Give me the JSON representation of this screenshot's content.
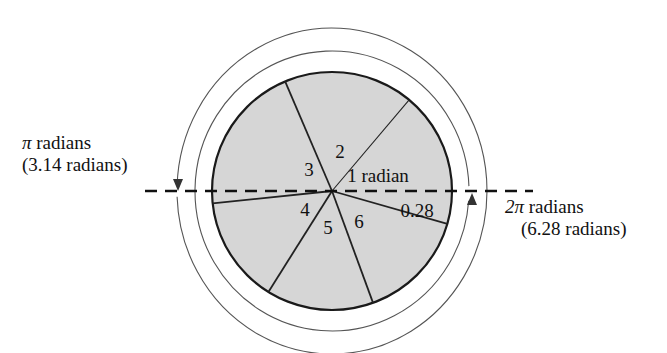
{
  "figure": {
    "colors": {
      "sector_fill": "#d6d6d6",
      "circle_stroke": "#1a1a1a",
      "arc_stroke": "#555555",
      "divider_stroke": "#222222",
      "dashed_stroke": "#111111",
      "background": "#ffffff"
    }
  },
  "annotations": {
    "left": {
      "line1_pi": "π",
      "line1_text": " radians",
      "line2": "(3.14 radians)"
    },
    "right": {
      "line1_pi": "2π",
      "line1_text": " radians",
      "line2": "(6.28 radians)"
    }
  },
  "sectors": [
    {
      "id": "sector-1",
      "label": "1 radian",
      "x": 378,
      "y": 176,
      "start_deg": 0,
      "end_deg": 50
    },
    {
      "id": "sector-2",
      "label": "2",
      "x": 340,
      "y": 152,
      "start_deg": 50,
      "end_deg": 113
    },
    {
      "id": "sector-3",
      "label": "3",
      "x": 309,
      "y": 170,
      "start_deg": 113,
      "end_deg": 186
    },
    {
      "id": "sector-4",
      "label": "4",
      "x": 305,
      "y": 210,
      "start_deg": 186,
      "end_deg": 238
    },
    {
      "id": "sector-5",
      "label": "5",
      "x": 328,
      "y": 228,
      "start_deg": 238,
      "end_deg": 290
    },
    {
      "id": "sector-6",
      "label": "6",
      "x": 359,
      "y": 222,
      "start_deg": 290,
      "end_deg": 344
    },
    {
      "id": "sector-7",
      "label": "0.28",
      "x": 417,
      "y": 211,
      "start_deg": 344,
      "end_deg": 360
    }
  ],
  "geometry": {
    "center_x": 332,
    "center_y": 191,
    "circle_rx": 120,
    "circle_ry": 119,
    "inner_arc_rx": 137,
    "inner_arc_ry": 140,
    "outer_arc_rx": 155,
    "outer_arc_ry": 163,
    "dashed_line_y": 191,
    "dashed_line_x1": 145,
    "dashed_line_x2": 533
  },
  "chart_data": {
    "type": "pie",
    "categories": [
      "1 radian",
      "2",
      "3",
      "4",
      "5",
      "6",
      "0.28"
    ],
    "values": [
      1,
      1,
      1,
      1,
      1,
      1,
      0.28
    ],
    "units": "radians",
    "total": 6.28,
    "notes": [
      "π radians (3.14 radians) is a half revolution",
      "2π radians (6.28 radians) is a full revolution"
    ]
  }
}
